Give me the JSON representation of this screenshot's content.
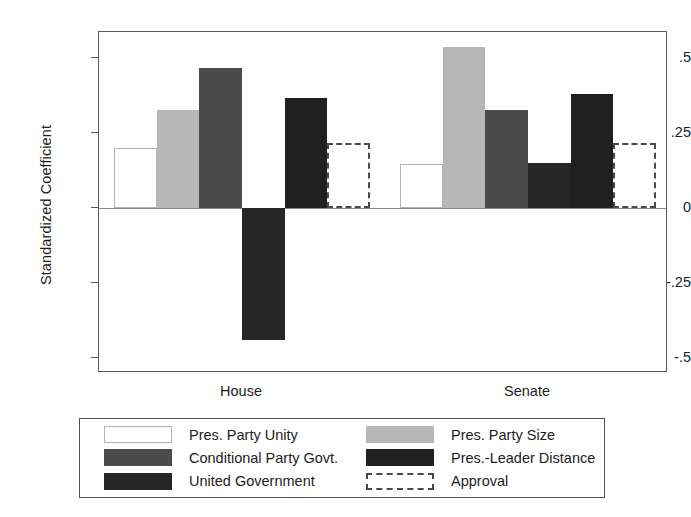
{
  "chart_data": {
    "type": "bar",
    "title": "",
    "subtitle": "",
    "xlabel": "",
    "ylabel": "Standardized Coefficient",
    "categories": [
      "House",
      "Senate"
    ],
    "ylim": [
      -0.55,
      0.585
    ],
    "yticks": [
      0.5,
      0.25,
      0,
      -0.25,
      -0.5
    ],
    "ytick_labels": [
      ".5",
      ".25",
      "0",
      "-.25",
      "-.5"
    ],
    "grid": false,
    "legend_position": "bottom",
    "zero_baseline": true,
    "series": [
      {
        "name": "Pres. Party Unity",
        "swatch": "swatch-white",
        "color": "#ffffff",
        "values": [
          0.2,
          0.145
        ]
      },
      {
        "name": "Pres. Party Size",
        "swatch": "swatch-lightgray",
        "color": "#b7b7b7",
        "values": [
          0.325,
          0.535
        ]
      },
      {
        "name": "Conditional Party Govt.",
        "swatch": "swatch-midgray",
        "color": "#4b4b4b",
        "values": [
          0.465,
          0.325
        ]
      },
      {
        "name": "United Government",
        "swatch": "swatch-dark",
        "color": "#262626",
        "values": [
          -0.44,
          0.15
        ]
      },
      {
        "name": "Pres.-Leader Distance",
        "swatch": "swatch-darkest",
        "color": "#202020",
        "values": [
          0.365,
          0.38
        ]
      },
      {
        "name": "Approval",
        "swatch": "swatch-dashed",
        "color": "#ffffff",
        "values": [
          0.215,
          0.215
        ]
      }
    ]
  },
  "legend": {
    "entries": [
      {
        "label": "Pres. Party Unity",
        "swatch": "swatch-white"
      },
      {
        "label": "Pres. Party Size",
        "swatch": "swatch-lightgray"
      },
      {
        "label": "Conditional Party Govt.",
        "swatch": "swatch-midgray"
      },
      {
        "label": "Pres.-Leader Distance",
        "swatch": "swatch-darkest"
      },
      {
        "label": "United Government",
        "swatch": "swatch-dark"
      },
      {
        "label": "Approval",
        "swatch": "swatch-dashed"
      }
    ]
  }
}
